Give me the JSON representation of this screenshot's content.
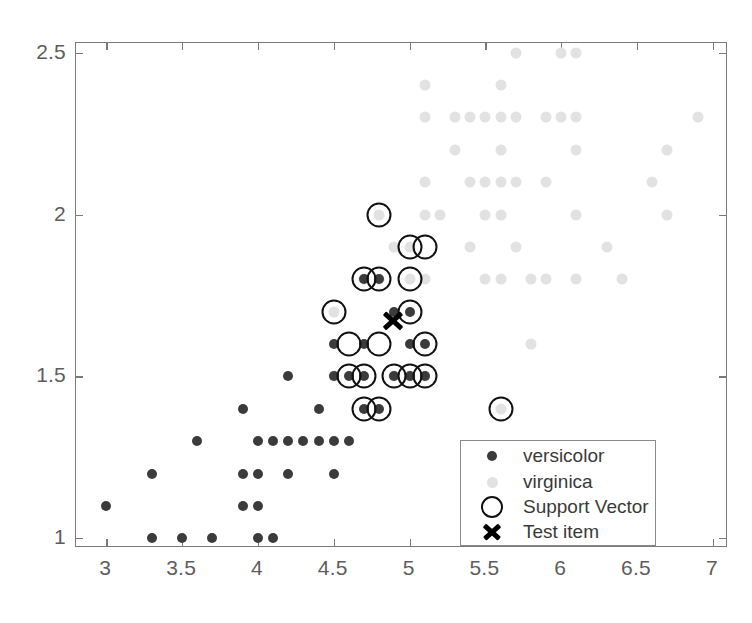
{
  "chart_data": {
    "type": "scatter",
    "title": "",
    "xlabel": "",
    "ylabel": "",
    "xlim": [
      2.8,
      7.1
    ],
    "ylim": [
      0.97,
      2.53
    ],
    "grid": false,
    "legend_position": "inside-bottom-right",
    "xticks": [
      3,
      3.5,
      4,
      4.5,
      5,
      5.5,
      6,
      6.5,
      7
    ],
    "xticklabels": [
      "3",
      "3.5",
      "4",
      "4.5",
      "5",
      "5.5",
      "6",
      "6.5",
      "7"
    ],
    "yticks": [
      1,
      1.5,
      2,
      2.5
    ],
    "yticklabels": [
      "1",
      "1.5",
      "2",
      "2.5"
    ],
    "series": [
      {
        "name": "versicolor",
        "marker": "filled-circle",
        "color": "#3b3b3b",
        "points": [
          [
            3.0,
            1.1
          ],
          [
            3.3,
            1.0
          ],
          [
            3.5,
            1.0
          ],
          [
            3.7,
            1.0
          ],
          [
            4.0,
            1.0
          ],
          [
            4.1,
            1.0
          ],
          [
            3.9,
            1.1
          ],
          [
            4.0,
            1.1
          ],
          [
            3.3,
            1.2
          ],
          [
            3.9,
            1.2
          ],
          [
            4.0,
            1.2
          ],
          [
            4.2,
            1.2
          ],
          [
            4.5,
            1.2
          ],
          [
            3.6,
            1.3
          ],
          [
            4.0,
            1.3
          ],
          [
            4.1,
            1.3
          ],
          [
            4.2,
            1.3
          ],
          [
            4.3,
            1.3
          ],
          [
            4.4,
            1.3
          ],
          [
            4.5,
            1.3
          ],
          [
            4.6,
            1.3
          ],
          [
            3.9,
            1.4
          ],
          [
            4.4,
            1.4
          ],
          [
            4.7,
            1.4
          ],
          [
            4.8,
            1.4
          ],
          [
            4.2,
            1.5
          ],
          [
            4.5,
            1.5
          ],
          [
            4.6,
            1.5
          ],
          [
            4.7,
            1.5
          ],
          [
            4.9,
            1.5
          ],
          [
            5.0,
            1.5
          ],
          [
            5.1,
            1.5
          ],
          [
            4.5,
            1.6
          ],
          [
            4.7,
            1.6
          ],
          [
            5.0,
            1.6
          ],
          [
            5.1,
            1.6
          ],
          [
            4.9,
            1.7
          ],
          [
            5.0,
            1.7
          ],
          [
            4.7,
            1.8
          ],
          [
            4.8,
            1.8
          ]
        ]
      },
      {
        "name": "virginica",
        "marker": "filled-circle",
        "color": "#e2e2e2",
        "points": [
          [
            5.6,
            1.4
          ],
          [
            5.8,
            1.6
          ],
          [
            4.5,
            1.5
          ],
          [
            4.9,
            1.5
          ],
          [
            5.0,
            1.5
          ],
          [
            5.1,
            1.5
          ],
          [
            4.5,
            1.7
          ],
          [
            5.1,
            1.8
          ],
          [
            5.5,
            1.8
          ],
          [
            5.6,
            1.8
          ],
          [
            5.8,
            1.8
          ],
          [
            5.9,
            1.8
          ],
          [
            6.1,
            1.8
          ],
          [
            6.4,
            1.8
          ],
          [
            4.7,
            1.8
          ],
          [
            4.8,
            1.8
          ],
          [
            5.0,
            1.8
          ],
          [
            4.9,
            1.9
          ],
          [
            5.0,
            1.9
          ],
          [
            5.4,
            1.9
          ],
          [
            5.7,
            1.9
          ],
          [
            6.3,
            1.9
          ],
          [
            4.8,
            2.0
          ],
          [
            5.1,
            2.0
          ],
          [
            5.2,
            2.0
          ],
          [
            5.5,
            2.0
          ],
          [
            5.6,
            2.0
          ],
          [
            6.1,
            2.0
          ],
          [
            6.7,
            2.0
          ],
          [
            5.1,
            2.1
          ],
          [
            5.4,
            2.1
          ],
          [
            5.5,
            2.1
          ],
          [
            5.6,
            2.1
          ],
          [
            5.7,
            2.1
          ],
          [
            5.9,
            2.1
          ],
          [
            6.6,
            2.1
          ],
          [
            5.3,
            2.2
          ],
          [
            5.6,
            2.2
          ],
          [
            6.1,
            2.2
          ],
          [
            6.7,
            2.2
          ],
          [
            5.1,
            2.3
          ],
          [
            5.3,
            2.3
          ],
          [
            5.4,
            2.3
          ],
          [
            5.5,
            2.3
          ],
          [
            5.6,
            2.3
          ],
          [
            5.7,
            2.3
          ],
          [
            5.9,
            2.3
          ],
          [
            6.0,
            2.3
          ],
          [
            6.1,
            2.3
          ],
          [
            6.9,
            2.3
          ],
          [
            5.1,
            2.4
          ],
          [
            5.6,
            2.4
          ],
          [
            5.7,
            2.5
          ],
          [
            6.0,
            2.5
          ],
          [
            6.1,
            2.5
          ]
        ]
      }
    ],
    "support_vectors": {
      "name": "Support Vector",
      "marker": "open-circle",
      "color": "#111111",
      "points": [
        [
          4.8,
          2.0
        ],
        [
          5.0,
          1.9
        ],
        [
          5.1,
          1.9
        ],
        [
          4.7,
          1.8
        ],
        [
          4.8,
          1.8
        ],
        [
          5.0,
          1.8
        ],
        [
          4.5,
          1.7
        ],
        [
          5.0,
          1.7
        ],
        [
          4.6,
          1.6
        ],
        [
          4.8,
          1.6
        ],
        [
          5.1,
          1.6
        ],
        [
          4.6,
          1.5
        ],
        [
          4.7,
          1.5
        ],
        [
          4.9,
          1.5
        ],
        [
          5.0,
          1.5
        ],
        [
          5.1,
          1.5
        ],
        [
          4.7,
          1.4
        ],
        [
          4.8,
          1.4
        ],
        [
          5.6,
          1.4
        ]
      ]
    },
    "test_item": {
      "name": "Test item",
      "marker": "x",
      "color": "#000000",
      "point": [
        4.89,
        1.67
      ]
    }
  },
  "legend": {
    "items": [
      {
        "label": "versicolor",
        "marker": "versicolor-dot-icon"
      },
      {
        "label": "virginica",
        "marker": "virginica-dot-icon"
      },
      {
        "label": "Support Vector",
        "marker": "support-vector-circle-icon"
      },
      {
        "label": "Test item",
        "marker": "test-item-x-icon"
      }
    ]
  }
}
